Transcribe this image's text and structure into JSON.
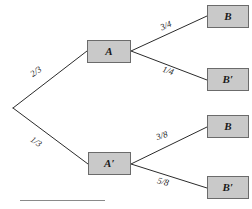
{
  "diagram": {
    "type": "probability-tree",
    "root": {
      "label": "",
      "x": 13,
      "y": 108
    },
    "stage1": {
      "nodes": [
        {
          "id": "A",
          "label": "A",
          "x": 87,
          "y": 40,
          "w": 44,
          "h": 23
        },
        {
          "id": "Ap",
          "label": "A′",
          "x": 88,
          "y": 152,
          "w": 43,
          "h": 23
        }
      ],
      "edges": [
        {
          "from": "root",
          "to": "A",
          "label": "2/3",
          "lx": 36,
          "ly": 72,
          "angle": -35
        },
        {
          "from": "root",
          "to": "Ap",
          "label": "1/3",
          "lx": 36,
          "ly": 142,
          "angle": 35
        }
      ]
    },
    "stage2": {
      "nodes": [
        {
          "id": "B1",
          "label": "B",
          "x": 207,
          "y": 5,
          "w": 42,
          "h": 23
        },
        {
          "id": "B1p",
          "label": "B′",
          "x": 207,
          "y": 68,
          "w": 42,
          "h": 23
        },
        {
          "id": "B2",
          "label": "B",
          "x": 207,
          "y": 115,
          "w": 42,
          "h": 23
        },
        {
          "id": "B2p",
          "label": "B′",
          "x": 207,
          "y": 176,
          "w": 42,
          "h": 23
        }
      ],
      "edges": [
        {
          "from": "A",
          "to": "B1",
          "label": "3/4",
          "lx": 166,
          "ly": 26,
          "angle": -23
        },
        {
          "from": "A",
          "to": "B1p",
          "label": "1/4",
          "lx": 168,
          "ly": 71,
          "angle": 19
        },
        {
          "from": "Ap",
          "to": "B2",
          "label": "3/8",
          "lx": 162,
          "ly": 136,
          "angle": -19
        },
        {
          "from": "Ap",
          "to": "B2p",
          "label": "5/8",
          "lx": 163,
          "ly": 182,
          "angle": 15
        }
      ]
    },
    "colors": {
      "box_fill": "#c9c9c9",
      "box_border": "#6b6b6b",
      "line": "#2b2b2b",
      "text": "#1a1a1a",
      "rule": "#8a8a8a",
      "background": "#ffffff"
    },
    "footer_rule": {
      "present": true
    }
  }
}
